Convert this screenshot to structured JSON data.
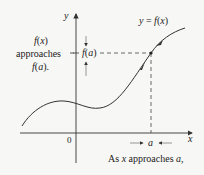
{
  "figure": {
    "axes": {
      "x_label": "x",
      "y_label": "y",
      "origin_label": "0"
    },
    "curve_label": {
      "y": "y",
      "eq": "=",
      "f": "f",
      "lparen": "(",
      "x": "x",
      "rparen": ")"
    },
    "point": {
      "x_label": "a",
      "y_label_f": "f",
      "y_label_arg": "a"
    },
    "left_annotation": {
      "line1_f": "f",
      "line1_arg": "x",
      "line2": "approaches",
      "line3_f": "f",
      "line3_arg": "a",
      "line3_end": "."
    },
    "bottom_annotation": {
      "prefix": "As ",
      "var": "x",
      "middle": " approaches ",
      "target": "a",
      "suffix": ","
    },
    "colors": {
      "background": "#f7f7f5",
      "ink": "#222222",
      "axis": "#333333"
    }
  }
}
